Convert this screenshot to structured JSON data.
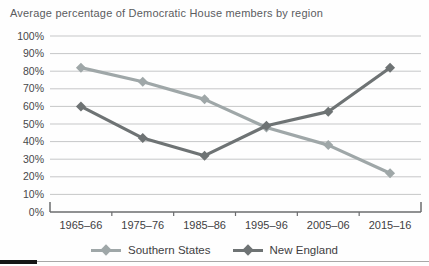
{
  "chart_data": {
    "type": "line",
    "title": "Average percentage of Democratic House members by region",
    "categories": [
      "1965–66",
      "1975–76",
      "1985–86",
      "1995–96",
      "2005–06",
      "2015–16"
    ],
    "series": [
      {
        "name": "Southern States",
        "color": "#9fa7a8",
        "values": [
          82,
          74,
          64,
          48,
          38,
          22
        ]
      },
      {
        "name": "New England",
        "color": "#6e7374",
        "values": [
          60,
          42,
          32,
          49,
          57,
          82
        ]
      }
    ],
    "ylim": [
      0,
      100
    ],
    "y_tick_step": 10,
    "y_tick_labels": [
      "0%",
      "10%",
      "20%",
      "30%",
      "40%",
      "50%",
      "60%",
      "70%",
      "80%",
      "90%",
      "100%"
    ],
    "grid": true,
    "marker": "diamond",
    "legend_position": "bottom"
  },
  "colors": {
    "background": "#fefefe",
    "title_text": "#5b5c5e",
    "axis_text": "#47484a",
    "gridline": "#c6c7c8",
    "axis": "#6b6c6e",
    "divider": "#a8a8a8",
    "divider_accent": "#161616"
  }
}
